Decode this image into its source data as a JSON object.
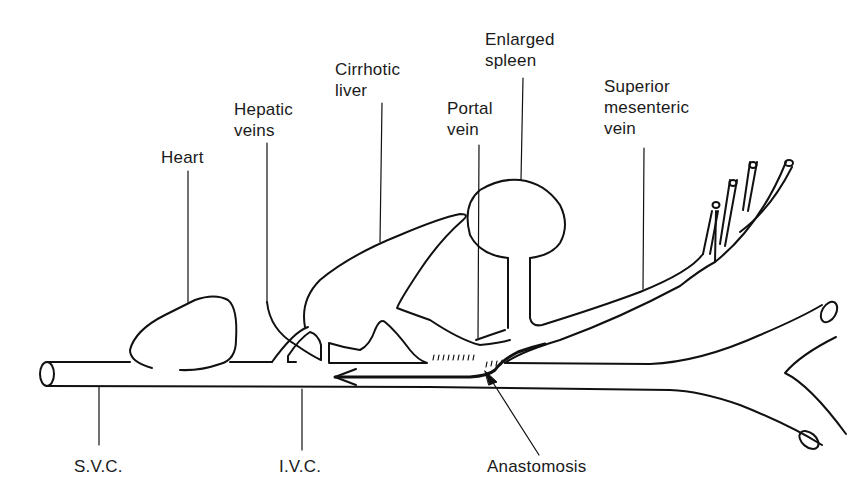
{
  "diagram": {
    "type": "anatomical schematic",
    "stroke_color": "#111111",
    "background": "#ffffff",
    "labels": {
      "heart": "Heart",
      "hepatic_veins": "Hepatic\nveins",
      "cirrhotic_liver": "Cirrhotic\nliver",
      "portal_vein": "Portal\nvein",
      "enlarged_spleen": "Enlarged\nspleen",
      "superior_mesenteric_vein": "Superior\nmesenteric\nvein",
      "svc": "S.V.C.",
      "ivc": "I.V.C.",
      "anastomosis": "Anastomosis"
    },
    "structures": [
      "Heart",
      "Hepatic veins",
      "Cirrhotic liver",
      "Portal vein",
      "Enlarged spleen",
      "Superior mesenteric vein",
      "S.V.C.",
      "I.V.C.",
      "Anastomosis"
    ],
    "flow_arrow": "Leftward arrow along vena cava showing shunted blood flow from portal system via anastomosis"
  }
}
